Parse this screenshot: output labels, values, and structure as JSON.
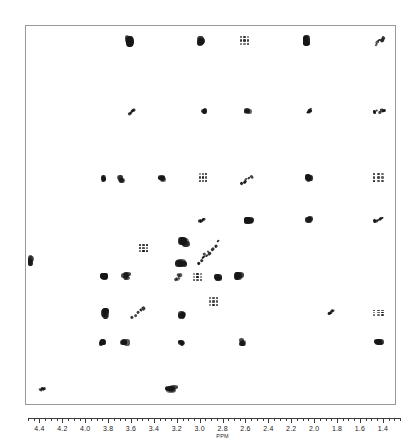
{
  "axis": {
    "unit_label": "PPM",
    "unit_label_at": 2.8,
    "min": 1.25,
    "max": 4.5,
    "direction": "descending",
    "major_step": 0.2,
    "minor_step": 0.05,
    "tick_labels": [
      "4.4",
      "4.2",
      "4.0",
      "3.8",
      "3.6",
      "3.4",
      "3.2",
      "3.0",
      "2.8",
      "2.6",
      "2.4",
      "2.2",
      "2.0",
      "1.8",
      "1.6",
      "1.4"
    ],
    "tick_values": [
      4.4,
      4.2,
      4.0,
      3.8,
      3.6,
      3.4,
      3.2,
      3.0,
      2.8,
      2.6,
      2.4,
      2.2,
      2.0,
      1.8,
      1.6,
      1.4
    ]
  },
  "colors": {
    "frame": "#9a9a9a",
    "peak": "#161616",
    "axis": "#3a3a3a",
    "background": "#ffffff"
  },
  "chart_data": {
    "type": "scatter",
    "xlabel": "PPM",
    "ylabel": "",
    "xlim": [
      4.5,
      1.25
    ],
    "grid": false,
    "legend": null,
    "note": "Contour cross-peak positions in plot-frame pixel coordinates (371x380 box). sx/sy = blob cluster size, rot = streak rotation deg.",
    "peaks": [
      {
        "x": 103,
        "y": 15,
        "sx": 9,
        "sy": 13,
        "rot": 0,
        "style": "cluster"
      },
      {
        "x": 175,
        "y": 15,
        "sx": 8,
        "sy": 12,
        "rot": 0,
        "style": "cluster"
      },
      {
        "x": 219,
        "y": 15,
        "sx": 11,
        "sy": 11,
        "rot": 0,
        "style": "grid"
      },
      {
        "x": 281,
        "y": 15,
        "sx": 8,
        "sy": 12,
        "rot": 0,
        "style": "cluster"
      },
      {
        "x": 353,
        "y": 15,
        "sx": 13,
        "sy": 8,
        "rot": -38,
        "style": "streak"
      },
      {
        "x": 105,
        "y": 85,
        "sx": 9,
        "sy": 7,
        "rot": -30,
        "style": "streak"
      },
      {
        "x": 178,
        "y": 85,
        "sx": 7,
        "sy": 8,
        "rot": 0,
        "style": "cluster"
      },
      {
        "x": 222,
        "y": 85,
        "sx": 8,
        "sy": 7,
        "rot": 0,
        "style": "cluster"
      },
      {
        "x": 283,
        "y": 85,
        "sx": 7,
        "sy": 8,
        "rot": -35,
        "style": "streak"
      },
      {
        "x": 353,
        "y": 85,
        "sx": 13,
        "sy": 7,
        "rot": -12,
        "style": "streak"
      },
      {
        "x": 77,
        "y": 153,
        "sx": 7,
        "sy": 8,
        "rot": 0,
        "style": "cluster"
      },
      {
        "x": 95,
        "y": 153,
        "sx": 8,
        "sy": 8,
        "rot": 0,
        "style": "cluster"
      },
      {
        "x": 136,
        "y": 153,
        "sx": 8,
        "sy": 8,
        "rot": 0,
        "style": "cluster"
      },
      {
        "x": 177,
        "y": 152,
        "sx": 9,
        "sy": 11,
        "rot": 0,
        "style": "grid"
      },
      {
        "x": 220,
        "y": 154,
        "sx": 15,
        "sy": 8,
        "rot": -40,
        "style": "streak"
      },
      {
        "x": 283,
        "y": 152,
        "sx": 9,
        "sy": 9,
        "rot": 0,
        "style": "cluster"
      },
      {
        "x": 353,
        "y": 152,
        "sx": 13,
        "sy": 11,
        "rot": 0,
        "style": "grid"
      },
      {
        "x": 176,
        "y": 194,
        "sx": 8,
        "sy": 9,
        "rot": -32,
        "style": "streak"
      },
      {
        "x": 223,
        "y": 194,
        "sx": 10,
        "sy": 8,
        "rot": 0,
        "style": "cluster"
      },
      {
        "x": 283,
        "y": 194,
        "sx": 9,
        "sy": 8,
        "rot": 0,
        "style": "cluster"
      },
      {
        "x": 352,
        "y": 194,
        "sx": 11,
        "sy": 8,
        "rot": -15,
        "style": "streak"
      },
      {
        "x": 5,
        "y": 235,
        "sx": 7,
        "sy": 12,
        "rot": 0,
        "style": "cluster"
      },
      {
        "x": 118,
        "y": 222,
        "sx": 10,
        "sy": 9,
        "rot": 0,
        "style": "grid"
      },
      {
        "x": 158,
        "y": 216,
        "sx": 12,
        "sy": 11,
        "rot": 0,
        "style": "cluster"
      },
      {
        "x": 186,
        "y": 222,
        "sx": 22,
        "sy": 11,
        "rot": -42,
        "style": "streak"
      },
      {
        "x": 155,
        "y": 237,
        "sx": 12,
        "sy": 10,
        "rot": 0,
        "style": "cluster"
      },
      {
        "x": 178,
        "y": 232,
        "sx": 18,
        "sy": 10,
        "rot": -42,
        "style": "streak"
      },
      {
        "x": 78,
        "y": 250,
        "sx": 9,
        "sy": 8,
        "rot": 0,
        "style": "cluster"
      },
      {
        "x": 100,
        "y": 250,
        "sx": 10,
        "sy": 9,
        "rot": 0,
        "style": "cluster"
      },
      {
        "x": 152,
        "y": 251,
        "sx": 10,
        "sy": 10,
        "rot": -40,
        "style": "streak"
      },
      {
        "x": 172,
        "y": 251,
        "sx": 11,
        "sy": 9,
        "rot": 0,
        "style": "grid"
      },
      {
        "x": 192,
        "y": 251,
        "sx": 9,
        "sy": 8,
        "rot": 0,
        "style": "cluster"
      },
      {
        "x": 79,
        "y": 287,
        "sx": 8,
        "sy": 13,
        "rot": 0,
        "style": "cluster"
      },
      {
        "x": 112,
        "y": 287,
        "sx": 18,
        "sy": 10,
        "rot": -40,
        "style": "streak"
      },
      {
        "x": 156,
        "y": 288,
        "sx": 8,
        "sy": 10,
        "rot": 0,
        "style": "cluster"
      },
      {
        "x": 188,
        "y": 276,
        "sx": 10,
        "sy": 10,
        "rot": 0,
        "style": "grid"
      },
      {
        "x": 213,
        "y": 250,
        "sx": 10,
        "sy": 10,
        "rot": 0,
        "style": "cluster"
      },
      {
        "x": 305,
        "y": 286,
        "sx": 8,
        "sy": 8,
        "rot": -28,
        "style": "streak"
      },
      {
        "x": 353,
        "y": 287,
        "sx": 13,
        "sy": 7,
        "rot": 0,
        "style": "grid"
      },
      {
        "x": 76,
        "y": 317,
        "sx": 9,
        "sy": 9,
        "rot": 0,
        "style": "cluster"
      },
      {
        "x": 99,
        "y": 316,
        "sx": 11,
        "sy": 8,
        "rot": 0,
        "style": "cluster"
      },
      {
        "x": 155,
        "y": 317,
        "sx": 8,
        "sy": 7,
        "rot": 0,
        "style": "cluster"
      },
      {
        "x": 216,
        "y": 316,
        "sx": 9,
        "sy": 8,
        "rot": 0,
        "style": "cluster"
      },
      {
        "x": 353,
        "y": 316,
        "sx": 11,
        "sy": 7,
        "rot": 0,
        "style": "cluster"
      },
      {
        "x": 16,
        "y": 363,
        "sx": 7,
        "sy": 7,
        "rot": -25,
        "style": "streak"
      },
      {
        "x": 146,
        "y": 363,
        "sx": 14,
        "sy": 8,
        "rot": 0,
        "style": "cluster"
      }
    ]
  }
}
